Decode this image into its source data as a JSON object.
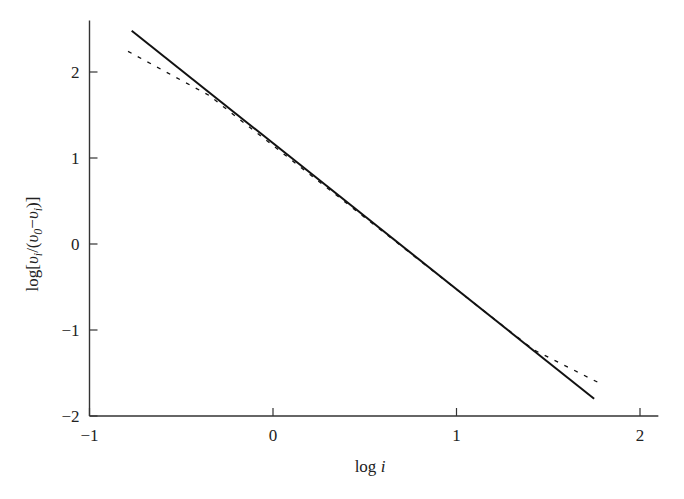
{
  "chart_data": {
    "type": "line",
    "title": "",
    "xlabel": "log i",
    "ylabel": "log[υ_i/(υ_0−υ_i)]",
    "xlim": [
      -1,
      2.1
    ],
    "ylim": [
      -2,
      2.6
    ],
    "xticks": [
      "-1",
      "0",
      "1",
      "2"
    ],
    "yticks": [
      "-2",
      "-1",
      "0",
      "1",
      "2"
    ],
    "grid": false,
    "legend": null,
    "series": [
      {
        "name": "linear fit",
        "style": "solid",
        "x": [
          -0.77,
          1.75
        ],
        "y": [
          2.48,
          -1.8
        ]
      },
      {
        "name": "curve",
        "style": "dashed",
        "x": [
          -0.79,
          -0.35,
          1.42,
          1.8
        ],
        "y": [
          2.24,
          1.73,
          -1.23,
          -1.64
        ]
      }
    ]
  },
  "labels": {
    "x_axis": "log",
    "x_axis_var": "i",
    "y_axis_prefix": "log[",
    "y_axis_v1": "υ",
    "y_axis_sub1": "i",
    "y_axis_mid": "/(",
    "y_axis_v2": "υ",
    "y_axis_sub2": "0",
    "y_axis_minus": "−",
    "y_axis_v3": "υ",
    "y_axis_sub3": "i",
    "y_axis_suffix": ")]"
  }
}
